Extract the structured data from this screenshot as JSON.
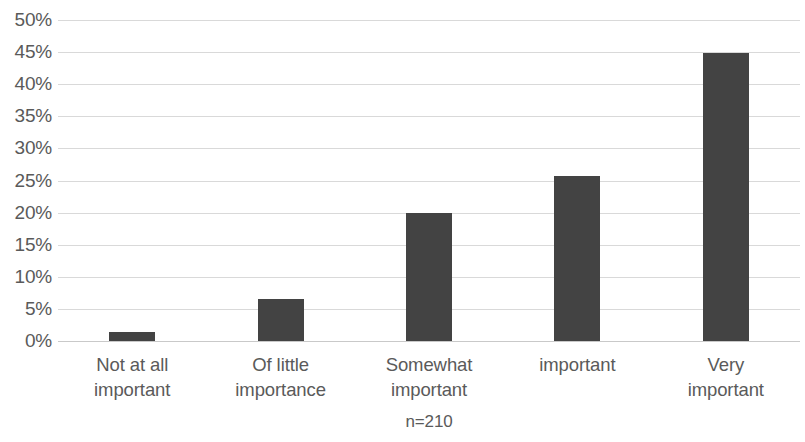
{
  "chart_data": {
    "type": "bar",
    "title": "",
    "subtitle": "",
    "xlabel": "",
    "ylabel": "",
    "categories": [
      "Not at all important",
      "Of little importance",
      "Somewhat important",
      "important",
      "Very important"
    ],
    "category_lines": [
      [
        "Not at all",
        "important"
      ],
      [
        "Of little",
        "importance"
      ],
      [
        "Somewhat",
        "important"
      ],
      [
        "important"
      ],
      [
        "Very",
        "important"
      ]
    ],
    "values": [
      1.4,
      6.5,
      20.0,
      25.7,
      44.8
    ],
    "value_labels": [
      "1.4%",
      "6.5%",
      "20.0%",
      "25.7%",
      "44.8%"
    ],
    "ylim": [
      0,
      50
    ],
    "ytick_labels": [
      "50%",
      "45%",
      "40%",
      "35%",
      "30%",
      "25%",
      "20%",
      "15%",
      "10%",
      "5%",
      "0%"
    ],
    "ytick_values": [
      50,
      45,
      40,
      35,
      30,
      25,
      20,
      15,
      10,
      5,
      0
    ],
    "grid": true,
    "grid_axis": "y",
    "legend": false,
    "annotation": "n=210",
    "colors": {
      "bar": "#434343",
      "gridline": "#d9d9d9",
      "axis": "#c9c9c9",
      "text": "#5a5a5a",
      "background": "#ffffff"
    }
  }
}
